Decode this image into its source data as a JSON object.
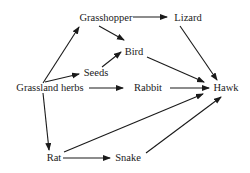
{
  "diagram": {
    "type": "food-web",
    "nodes": {
      "grasshopper": {
        "label": "Grasshopper",
        "x": 106,
        "y": 21
      },
      "lizard": {
        "label": "Lizard",
        "x": 188,
        "y": 21
      },
      "bird": {
        "label": "Bird",
        "x": 134,
        "y": 55
      },
      "seeds": {
        "label": "Seeds",
        "x": 96,
        "y": 76
      },
      "grassland_herbs": {
        "label": "Grassland herbs",
        "x": 50,
        "y": 91
      },
      "rabbit": {
        "label": "Rabbit",
        "x": 148,
        "y": 91
      },
      "hawk": {
        "label": "Hawk",
        "x": 226,
        "y": 91
      },
      "rat": {
        "label": "Rat",
        "x": 54,
        "y": 161
      },
      "snake": {
        "label": "Snake",
        "x": 128,
        "y": 161
      }
    },
    "edges": [
      {
        "from": "grassland_herbs",
        "to": "grasshopper"
      },
      {
        "from": "grassland_herbs",
        "to": "seeds"
      },
      {
        "from": "grassland_herbs",
        "to": "rabbit"
      },
      {
        "from": "grassland_herbs",
        "to": "rat"
      },
      {
        "from": "grasshopper",
        "to": "lizard"
      },
      {
        "from": "grasshopper",
        "to": "bird"
      },
      {
        "from": "seeds",
        "to": "bird"
      },
      {
        "from": "lizard",
        "to": "hawk"
      },
      {
        "from": "bird",
        "to": "hawk"
      },
      {
        "from": "rabbit",
        "to": "hawk"
      },
      {
        "from": "rat",
        "to": "hawk"
      },
      {
        "from": "rat",
        "to": "snake"
      },
      {
        "from": "snake",
        "to": "hawk"
      }
    ]
  }
}
